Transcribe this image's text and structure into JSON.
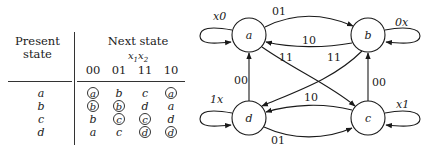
{
  "table": {
    "present_header_line1": "Present",
    "present_header_line2": "state",
    "next_header": "Next state",
    "input_var_1": "x",
    "input_var_1_sub": "1",
    "input_var_2": "x",
    "input_var_2_sub": "2",
    "columns": [
      "00",
      "01",
      "11",
      "10"
    ],
    "rows": [
      {
        "state": "a",
        "cells": [
          {
            "v": "a",
            "stable": true
          },
          {
            "v": "b",
            "stable": false
          },
          {
            "v": "c",
            "stable": false
          },
          {
            "v": "a",
            "stable": true
          }
        ]
      },
      {
        "state": "b",
        "cells": [
          {
            "v": "b",
            "stable": true
          },
          {
            "v": "b",
            "stable": true
          },
          {
            "v": "d",
            "stable": false
          },
          {
            "v": "a",
            "stable": false
          }
        ]
      },
      {
        "state": "c",
        "cells": [
          {
            "v": "b",
            "stable": false
          },
          {
            "v": "c",
            "stable": true
          },
          {
            "v": "c",
            "stable": true
          },
          {
            "v": "d",
            "stable": false
          }
        ]
      },
      {
        "state": "d",
        "cells": [
          {
            "v": "a",
            "stable": false
          },
          {
            "v": "c",
            "stable": false
          },
          {
            "v": "d",
            "stable": true
          },
          {
            "v": "d",
            "stable": true
          }
        ]
      }
    ]
  },
  "diagram": {
    "nodes": [
      {
        "id": "a",
        "label": "a",
        "self_loop": "x0"
      },
      {
        "id": "b",
        "label": "b",
        "self_loop": "0x"
      },
      {
        "id": "c",
        "label": "c",
        "self_loop": "x1"
      },
      {
        "id": "d",
        "label": "d",
        "self_loop": "1x"
      }
    ],
    "edges": [
      {
        "from": "a",
        "to": "b",
        "label": "01"
      },
      {
        "from": "b",
        "to": "a",
        "label": "10"
      },
      {
        "from": "a",
        "to": "c",
        "label": "11"
      },
      {
        "from": "b",
        "to": "d",
        "label": "11"
      },
      {
        "from": "d",
        "to": "a",
        "label": "00"
      },
      {
        "from": "c",
        "to": "b",
        "label": "00"
      },
      {
        "from": "c",
        "to": "d",
        "label": "10"
      },
      {
        "from": "d",
        "to": "c",
        "label": "01"
      }
    ]
  }
}
